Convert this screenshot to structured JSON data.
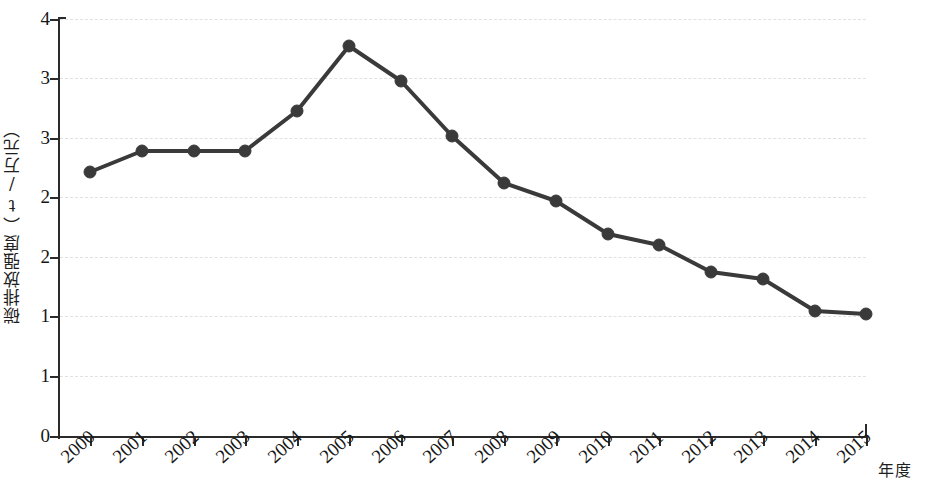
{
  "chart_data": {
    "type": "line",
    "title": "",
    "subtitle": "",
    "xlabel": "年度",
    "ylabel": "碳排放强度（t/万元）",
    "categories": [
      "2000",
      "2001",
      "2002",
      "2003",
      "2004",
      "2005",
      "2006",
      "2007",
      "2008",
      "2009",
      "2010",
      "2011",
      "2012",
      "2013",
      "2014",
      "2015"
    ],
    "series": [
      {
        "name": "碳排放强度",
        "values": [
          2.45,
          2.8,
          2.8,
          2.8,
          3.22,
          3.55,
          3.27,
          2.9,
          2.52,
          2.35,
          2.1,
          1.98,
          1.72,
          1.67,
          1.35,
          1.33
        ],
        "color": "#3a3a3a",
        "marker": "circle",
        "marker_size": 9,
        "line_width": 4
      }
    ],
    "x_tick_labels": [
      "2000",
      "2001",
      "2002",
      "2003",
      "2004",
      "2005",
      "2006",
      "2007",
      "2008",
      "2009",
      "2010",
      "2011",
      "2012",
      "2013",
      "2014",
      "2015"
    ],
    "y_tick_labels": [
      "4",
      "3",
      "3",
      "2",
      "2",
      "1",
      "1",
      "0"
    ],
    "ylim": [
      0,
      4
    ],
    "xlim": [
      2000,
      2015
    ],
    "grid": true,
    "grid_style": "dashed",
    "grid_color": "#dcdcdc",
    "legend": false,
    "legend_position": "none",
    "x_label_rotation": -42,
    "background": "#ffffff",
    "axis_color": "#2b2b2b"
  },
  "axis": {
    "y_title": "碳排放强度（t/万元）",
    "x_title": "年度"
  },
  "y_ticks": [
    {
      "label": "4",
      "pos": 19
    },
    {
      "label": "3",
      "pos": 78
    },
    {
      "label": "3",
      "pos": 138
    },
    {
      "label": "2",
      "pos": 197
    },
    {
      "label": "2",
      "pos": 257
    },
    {
      "label": "1",
      "pos": 316
    },
    {
      "label": "1",
      "pos": 376
    },
    {
      "label": "0",
      "pos": 436
    }
  ],
  "x_ticks": [
    {
      "label": "2000",
      "pos": 90
    },
    {
      "label": "2001",
      "pos": 142
    },
    {
      "label": "2002",
      "pos": 194
    },
    {
      "label": "2003",
      "pos": 245
    },
    {
      "label": "2004",
      "pos": 297
    },
    {
      "label": "2005",
      "pos": 349
    },
    {
      "label": "2006",
      "pos": 401
    },
    {
      "label": "2007",
      "pos": 452
    },
    {
      "label": "2008",
      "pos": 504
    },
    {
      "label": "2009",
      "pos": 556
    },
    {
      "label": "2010",
      "pos": 608
    },
    {
      "label": "2011",
      "pos": 659
    },
    {
      "label": "2012",
      "pos": 711
    },
    {
      "label": "2013",
      "pos": 763
    },
    {
      "label": "2014",
      "pos": 815
    },
    {
      "label": "2015",
      "pos": 866
    }
  ],
  "points": [
    {
      "year": "2000",
      "x": 90,
      "y": 172
    },
    {
      "year": "2001",
      "x": 142,
      "y": 151
    },
    {
      "year": "2002",
      "x": 194,
      "y": 151
    },
    {
      "year": "2003",
      "x": 245,
      "y": 151
    },
    {
      "year": "2004",
      "x": 297,
      "y": 111
    },
    {
      "year": "2005",
      "x": 349,
      "y": 46
    },
    {
      "year": "2006",
      "x": 401,
      "y": 81
    },
    {
      "year": "2007",
      "x": 452,
      "y": 136
    },
    {
      "year": "2008",
      "x": 504,
      "y": 183
    },
    {
      "year": "2009",
      "x": 556,
      "y": 201
    },
    {
      "year": "2010",
      "x": 608,
      "y": 234
    },
    {
      "year": "2011",
      "x": 659,
      "y": 245
    },
    {
      "year": "2012",
      "x": 711,
      "y": 272
    },
    {
      "year": "2013",
      "x": 763,
      "y": 279
    },
    {
      "year": "2014",
      "x": 815,
      "y": 311
    },
    {
      "year": "2015",
      "x": 866,
      "y": 314
    }
  ]
}
